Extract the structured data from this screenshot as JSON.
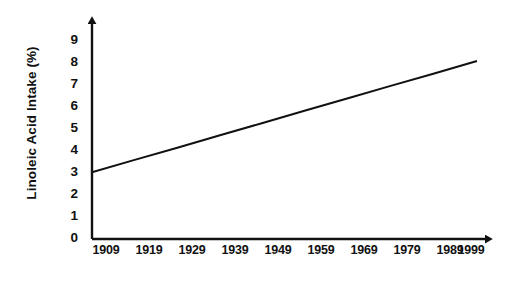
{
  "chart_data": {
    "type": "line",
    "title": "",
    "xlabel": "Year",
    "ylabel": "Linoleic Acid Intake (%)",
    "x": [
      1909,
      1919,
      1929,
      1939,
      1949,
      1959,
      1969,
      1979,
      1989,
      1999
    ],
    "xtick_labels": [
      "1909",
      "1919",
      "1929",
      "1939",
      "1949",
      "1959",
      "1969",
      "1979",
      "1989",
      "1999"
    ],
    "ytick_labels": [
      "0",
      "1",
      "2",
      "3",
      "4",
      "5",
      "6",
      "7",
      "8",
      "9"
    ],
    "yticks": [
      0,
      1,
      2,
      3,
      4,
      5,
      6,
      7,
      8,
      9
    ],
    "xlim": [
      1909,
      1999
    ],
    "ylim": [
      0,
      9
    ],
    "grid": false,
    "legend": "none",
    "series": [
      {
        "name": "Linoleic Acid Intake",
        "values": [
          3.0,
          3.56,
          4.11,
          4.67,
          5.22,
          5.78,
          6.33,
          6.89,
          7.44,
          8.0
        ],
        "color": "#111111",
        "line_width": 2
      }
    ],
    "annotations": [],
    "axis_style": {
      "arrow_heads": true,
      "tick_marks": false,
      "axis_color": "#111111"
    }
  }
}
